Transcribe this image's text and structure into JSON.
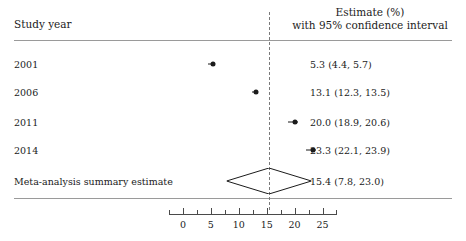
{
  "headers": {
    "study_column": "Study year",
    "estimate_column_line1": "Estimate (%)",
    "estimate_column_line2": "with 95% confidence interval"
  },
  "chart_data": {
    "type": "forest",
    "title": "",
    "xlabel": "",
    "ylabel": "",
    "xlim": [
      -2.5,
      27.5
    ],
    "xticks": [
      0,
      5,
      10,
      15,
      20,
      25
    ],
    "xtick_labels": [
      "0",
      "5",
      "10",
      "15",
      "20",
      "25"
    ],
    "minor_xticks": [
      -2.5,
      2.5,
      7.5,
      12.5,
      17.5,
      22.5,
      27.5
    ],
    "grid": false,
    "reference_line": 15.4,
    "reference_line_style": "dashed",
    "marker_shape": "circle",
    "summary_shape": "diamond",
    "rows": [
      {
        "study": "2001",
        "estimate": 5.3,
        "ci_low": 4.4,
        "ci_high": 5.7,
        "text": "5.3 (4.4, 5.7)",
        "is_summary": false
      },
      {
        "study": "2006",
        "estimate": 13.1,
        "ci_low": 12.3,
        "ci_high": 13.5,
        "text": "13.1 (12.3, 13.5)",
        "is_summary": false
      },
      {
        "study": "2011",
        "estimate": 20.0,
        "ci_low": 18.9,
        "ci_high": 20.6,
        "text": "20.0 (18.9, 20.6)",
        "is_summary": false
      },
      {
        "study": "2014",
        "estimate": 23.3,
        "ci_low": 22.1,
        "ci_high": 23.9,
        "text": "23.3 (22.1, 23.9)",
        "is_summary": false
      },
      {
        "study": "Meta-analysis summary estimate",
        "estimate": 15.4,
        "ci_low": 7.8,
        "ci_high": 23.0,
        "text": "15.4 (7.8, 23.0)",
        "is_summary": true
      }
    ]
  },
  "colors": {
    "text": "#1b1b1b",
    "rule": "#9a9a9a",
    "axis": "#4a4a4a",
    "reference_line": "#7a7a7a",
    "marker": "#1b1b1b"
  }
}
